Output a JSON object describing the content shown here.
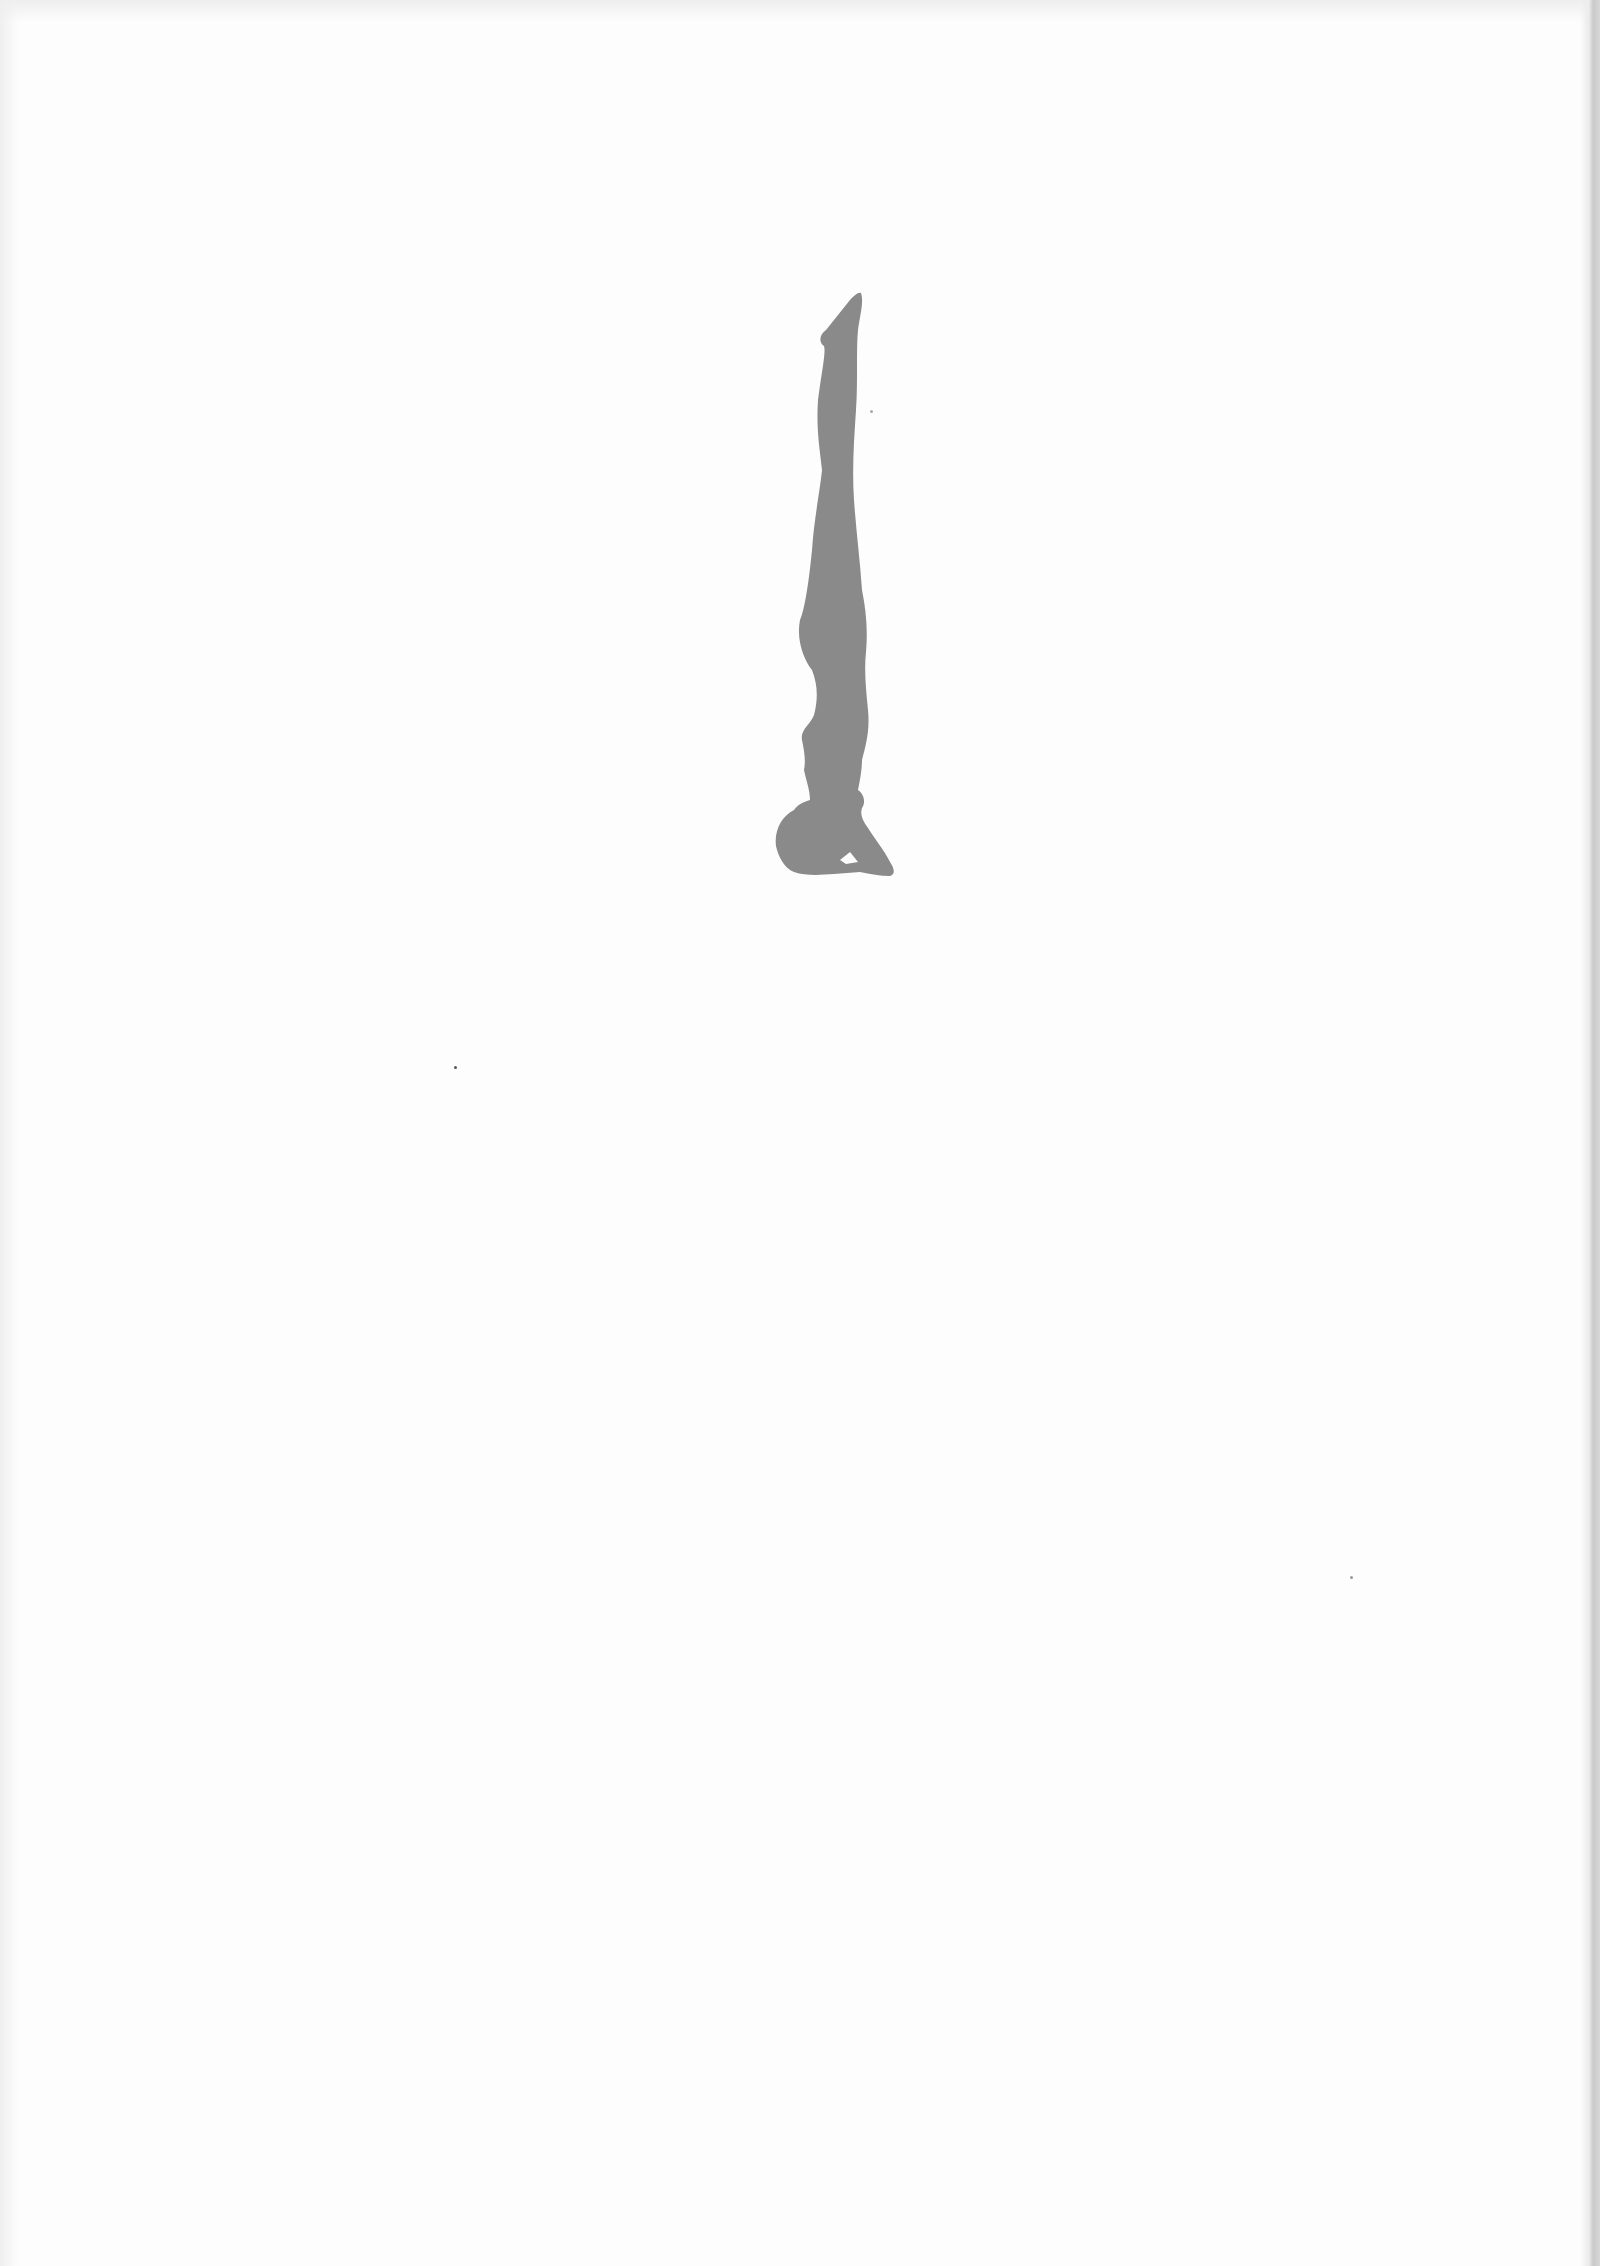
{
  "page": {
    "background_color": "#fdfdfd",
    "figure": {
      "subject": "headstand-silhouette",
      "fill_color": "#8a8a8a"
    },
    "specks": [
      {
        "x": 454,
        "y": 1066
      },
      {
        "x": 1350,
        "y": 1576
      },
      {
        "x": 870,
        "y": 410
      }
    ]
  }
}
